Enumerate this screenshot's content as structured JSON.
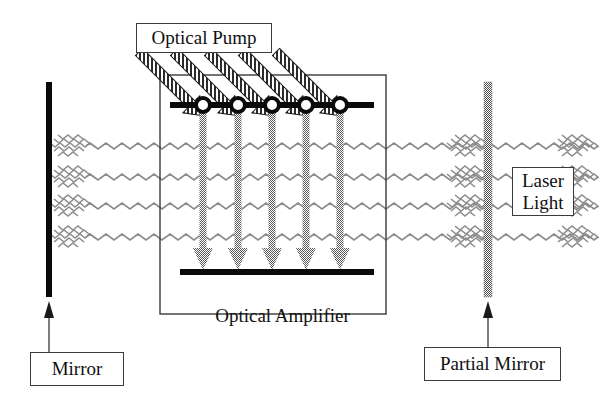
{
  "diagram": {
    "canvas": {
      "width": 599,
      "height": 411,
      "background": "#ffffff"
    },
    "labels": {
      "optical_pump": "Optical Pump",
      "optical_amplifier": "Optical Amplifier",
      "mirror": "Mirror",
      "partial_mirror": "Partial Mirror",
      "laser_light_line1": "Laser",
      "laser_light_line2": "Light"
    },
    "colors": {
      "stroke": "#101010",
      "box_border": "#3a3a3a",
      "mirror_fill": "#0a0a0a",
      "partial_mirror_fill": "#8a8a8a",
      "beam": "#8f8f8f",
      "down_arrow": "#7b7b7b",
      "pump_arrow_hatch": "#2b2b2b",
      "background": "#ffffff"
    },
    "geometry": {
      "amplifier_box": {
        "x": 160,
        "y": 75,
        "width": 226,
        "height": 239
      },
      "upper_level_line": {
        "x1": 170,
        "x2": 374,
        "y": 105,
        "thickness": 6
      },
      "lower_level_line": {
        "x1": 180,
        "x2": 374,
        "y": 272,
        "thickness": 6
      },
      "atom_circle_x": [
        203,
        238,
        272,
        306,
        340
      ],
      "atom_circle_y": 105,
      "atom_circle_radius": 7,
      "decay_arrow_tip_y": 266,
      "pump_arrow_count": 5,
      "pump_arrow_angle_deg": 45,
      "beam_y": [
        146,
        177,
        206,
        237
      ],
      "beam_x_start": 58,
      "beam_x_end": 597,
      "left_mirror": {
        "x": 46,
        "y": 82,
        "width": 6,
        "height": 215
      },
      "right_partial_mirror": {
        "x": 484,
        "y": 82,
        "width": 8,
        "height": 215
      },
      "mirror_callout_arrow": {
        "x": 49,
        "y_from": 349,
        "y_to": 305
      },
      "partial_mirror_callout_arrow": {
        "x": 488,
        "y_from": 344,
        "y_to": 305
      }
    },
    "elements": [
      {
        "name": "optical-pump-label",
        "kind": "label-box"
      },
      {
        "name": "pump-beam-arrow",
        "kind": "hatched-diagonal-arrow",
        "count": 5
      },
      {
        "name": "amplifier-enclosure",
        "kind": "rectangle"
      },
      {
        "name": "upper-energy-level",
        "kind": "thick-line"
      },
      {
        "name": "atom-circle",
        "kind": "circle",
        "count": 5
      },
      {
        "name": "stimulated-decay-arrow",
        "kind": "vertical-arrow",
        "count": 5
      },
      {
        "name": "lower-energy-level",
        "kind": "thick-line"
      },
      {
        "name": "laser-beam-wave",
        "kind": "wavy-line",
        "count": 4
      },
      {
        "name": "left-mirror-bar",
        "kind": "solid-bar"
      },
      {
        "name": "right-partial-mirror-bar",
        "kind": "dithered-bar"
      },
      {
        "name": "mirror-callout",
        "kind": "label-box-with-arrow"
      },
      {
        "name": "partial-mirror-callout",
        "kind": "label-box-with-arrow"
      },
      {
        "name": "laser-light-callout",
        "kind": "label-box"
      }
    ]
  }
}
